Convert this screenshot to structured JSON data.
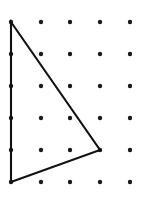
{
  "figure": {
    "name": "geoboard-triangle",
    "width": 152,
    "height": 198,
    "background_color": "#ffffff"
  },
  "chart_data": {
    "type": "scatter",
    "title": "",
    "subtitle": "",
    "xlabel": "",
    "ylabel": "",
    "grid": false,
    "legend_position": "none",
    "dot_grid": {
      "columns": 5,
      "rows": 6,
      "total_dots": 30,
      "x_positions": [
        11,
        41,
        70,
        100,
        130
      ],
      "y_positions": [
        22,
        54,
        86,
        118,
        150,
        182
      ],
      "x_spacing": 29.75,
      "y_spacing": 32,
      "dot_radius": 2.2,
      "dot_color": "#1a1a1a",
      "points": [
        {
          "col": 0,
          "row": 0,
          "x": 11,
          "y": 22
        },
        {
          "col": 1,
          "row": 0,
          "x": 41,
          "y": 22
        },
        {
          "col": 2,
          "row": 0,
          "x": 70,
          "y": 22
        },
        {
          "col": 3,
          "row": 0,
          "x": 100,
          "y": 22
        },
        {
          "col": 4,
          "row": 0,
          "x": 130,
          "y": 22
        },
        {
          "col": 0,
          "row": 1,
          "x": 11,
          "y": 54
        },
        {
          "col": 1,
          "row": 1,
          "x": 41,
          "y": 54
        },
        {
          "col": 2,
          "row": 1,
          "x": 70,
          "y": 54
        },
        {
          "col": 3,
          "row": 1,
          "x": 100,
          "y": 54
        },
        {
          "col": 4,
          "row": 1,
          "x": 130,
          "y": 54
        },
        {
          "col": 0,
          "row": 2,
          "x": 11,
          "y": 86
        },
        {
          "col": 1,
          "row": 2,
          "x": 41,
          "y": 86
        },
        {
          "col": 2,
          "row": 2,
          "x": 70,
          "y": 86
        },
        {
          "col": 3,
          "row": 2,
          "x": 100,
          "y": 86
        },
        {
          "col": 4,
          "row": 2,
          "x": 130,
          "y": 86
        },
        {
          "col": 0,
          "row": 3,
          "x": 11,
          "y": 118
        },
        {
          "col": 1,
          "row": 3,
          "x": 41,
          "y": 118
        },
        {
          "col": 2,
          "row": 3,
          "x": 70,
          "y": 118
        },
        {
          "col": 3,
          "row": 3,
          "x": 100,
          "y": 118
        },
        {
          "col": 4,
          "row": 3,
          "x": 130,
          "y": 118
        },
        {
          "col": 0,
          "row": 4,
          "x": 11,
          "y": 150
        },
        {
          "col": 1,
          "row": 4,
          "x": 41,
          "y": 150
        },
        {
          "col": 2,
          "row": 4,
          "x": 70,
          "y": 150
        },
        {
          "col": 3,
          "row": 4,
          "x": 100,
          "y": 150
        },
        {
          "col": 4,
          "row": 4,
          "x": 130,
          "y": 150
        },
        {
          "col": 0,
          "row": 5,
          "x": 11,
          "y": 182
        },
        {
          "col": 1,
          "row": 5,
          "x": 41,
          "y": 182
        },
        {
          "col": 2,
          "row": 5,
          "x": 70,
          "y": 182
        },
        {
          "col": 3,
          "row": 5,
          "x": 100,
          "y": 182
        },
        {
          "col": 4,
          "row": 5,
          "x": 130,
          "y": 182
        }
      ]
    },
    "shapes": [
      {
        "name": "triangle",
        "closed": true,
        "stroke_color": "#111111",
        "stroke_width": 2.1,
        "fill": "none",
        "vertices": [
          {
            "label": "top-left-vertex",
            "col": 0,
            "row": 0,
            "x": 11,
            "y": 22
          },
          {
            "label": "right-vertex",
            "col": 3,
            "row": 4,
            "x": 100,
            "y": 150
          },
          {
            "label": "bottom-left-vertex",
            "col": 0,
            "row": 5,
            "x": 11,
            "y": 182
          }
        ],
        "points_attr": "11,22 100,150 11,182"
      }
    ]
  }
}
